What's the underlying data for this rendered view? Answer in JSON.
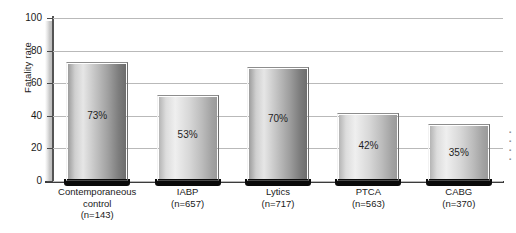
{
  "chart_data": {
    "type": "bar",
    "title": "",
    "xlabel": "",
    "ylabel": "Fatality rate",
    "ylim": [
      0,
      100
    ],
    "yticks": [
      0,
      20,
      40,
      60,
      80,
      100
    ],
    "grid": true,
    "legend": "none",
    "categories": [
      "Contemporaneous control",
      "IABP",
      "Lytics",
      "PTCA",
      "CABG"
    ],
    "category_lines": [
      [
        "Contemporaneous",
        "control",
        "(n=143)"
      ],
      [
        "IABP",
        "(n=657)"
      ],
      [
        "Lytics",
        "(n=717)"
      ],
      [
        "PTCA",
        "(n=563)"
      ],
      [
        "CABG",
        "(n=370)"
      ]
    ],
    "values": [
      73,
      53,
      70,
      42,
      35
    ],
    "data_labels": [
      "73%",
      "53%",
      "70%",
      "42%",
      "35%"
    ],
    "sample_sizes": [
      "n=143",
      "n=657",
      "n=717",
      "n=563",
      "n=370"
    ],
    "bars": [
      {
        "category": "Contemporaneous control",
        "value": 73,
        "label": "73%",
        "n": "(n=143)",
        "shade": "dark"
      },
      {
        "category": "IABP",
        "value": 53,
        "label": "53%",
        "n": "(n=657)",
        "shade": "light"
      },
      {
        "category": "Lytics",
        "value": 70,
        "label": "70%",
        "n": "(n=717)",
        "shade": "dark"
      },
      {
        "category": "PTCA",
        "value": 42,
        "label": "42%",
        "n": "(n=563)",
        "shade": "light"
      },
      {
        "category": "CABG",
        "value": 35,
        "label": "35%",
        "n": "(n=370)",
        "shade": "light"
      }
    ]
  },
  "axis": {
    "y_title": "Fatality rate",
    "ticks": [
      "100",
      "80",
      "60",
      "40",
      "20",
      "0"
    ]
  },
  "colors": {
    "gridline": "#b9b9b9",
    "axis": "#3c3c3c",
    "bar_foot": "#0a0a0a",
    "text": "#1a1a1a",
    "background": "#ffffff"
  }
}
